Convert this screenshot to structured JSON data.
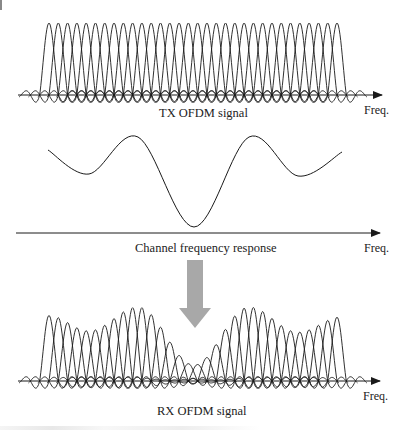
{
  "figure": {
    "panels": [
      {
        "id": "tx",
        "title": "TX OFDM signal",
        "axis_label": "Freq.",
        "baseline_y": 95,
        "axis_x_start": 18,
        "axis_x_end": 382,
        "subcarrier_count": 32,
        "first_peak_x": 49,
        "last_peak_x": 337,
        "peak_height": 72
      },
      {
        "id": "channel",
        "title": "Channel frequency response",
        "axis_label": "Freq.",
        "baseline_y": 233,
        "axis_x_start": 16,
        "axis_x_end": 380,
        "curve_points": [
          [
            48,
            150
          ],
          [
            89,
            174
          ],
          [
            138,
            137
          ],
          [
            194,
            227
          ],
          [
            249,
            137
          ],
          [
            298,
            176
          ],
          [
            342,
            152
          ]
        ]
      },
      {
        "id": "rx",
        "title": "RX OFDM signal",
        "axis_label": "Freq.",
        "baseline_y": 381,
        "axis_x_start": 18,
        "axis_x_end": 380,
        "subcarrier_count": 32,
        "first_peak_x": 49,
        "last_peak_x": 337
      }
    ],
    "transition_arrow": {
      "color": "#a8a8a8",
      "x_center": 195,
      "y_top": 260,
      "y_bottom": 328
    },
    "line_color": "#1a1a1a",
    "caption_visible_text": ""
  }
}
